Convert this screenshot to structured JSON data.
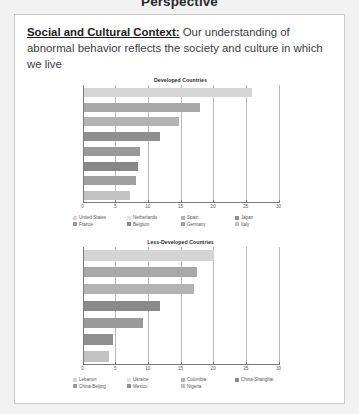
{
  "slide": {
    "title": "Perspective"
  },
  "body": {
    "lead": "Social and Cultural Context:",
    "text": " Our understanding of abnormal behavior reflects the society and culture in which we live"
  },
  "chart_data": [
    {
      "type": "bar",
      "orientation": "horizontal",
      "title": "Developed Countries",
      "xlabel": "",
      "ylabel": "",
      "xlim": [
        0,
        30
      ],
      "ticks": [
        0,
        5,
        10,
        15,
        20,
        25,
        30
      ],
      "tick_labels": [
        "0",
        "5",
        "10",
        "15",
        "20",
        "25",
        "30"
      ],
      "grid": true,
      "legend_position": "bottom",
      "categories": [
        "United States",
        "Netherlands",
        "Spain",
        "Japan",
        "France",
        "Belgium",
        "Germany",
        "Italy"
      ],
      "values": [
        26.0,
        18.0,
        14.8,
        11.8,
        8.8,
        8.5,
        8.2,
        7.3
      ],
      "colors": [
        "#d5d5d5",
        "#a8a8a8",
        "#b3b3b3",
        "#8f8f8f",
        "#9a9a9a",
        "#878787",
        "#a0a0a0",
        "#c2c2c2"
      ],
      "legend": [
        {
          "label": "United States",
          "color": "#d5d5d5"
        },
        {
          "label": "Netherlands",
          "color": "#e2e2e2"
        },
        {
          "label": "Spain",
          "color": "#b3b3b3"
        },
        {
          "label": "Japan",
          "color": "#8f8f8f"
        },
        {
          "label": "France",
          "color": "#9a9a9a"
        },
        {
          "label": "Belgium",
          "color": "#878787"
        },
        {
          "label": "Germany",
          "color": "#a0a0a0"
        },
        {
          "label": "Italy",
          "color": "#c2c2c2"
        }
      ]
    },
    {
      "type": "bar",
      "orientation": "horizontal",
      "title": "Less-Developed Countries",
      "xlabel": "",
      "ylabel": "",
      "xlim": [
        0,
        30
      ],
      "ticks": [
        0,
        5,
        10,
        15,
        20,
        25,
        30
      ],
      "tick_labels": [
        "0",
        "5",
        "10",
        "15",
        "20",
        "25",
        "30"
      ],
      "grid": true,
      "legend_position": "bottom",
      "categories": [
        "Lebanon",
        "Ukraine",
        "Colombia",
        "China-Shanghai",
        "China-Beijing",
        "Mexico",
        "Nigeria"
      ],
      "values": [
        20.2,
        17.5,
        17.0,
        11.8,
        9.2,
        4.6,
        4.1
      ],
      "colors": [
        "#d5d5d5",
        "#a8a8a8",
        "#b3b3b3",
        "#8a8a8a",
        "#9a9a9a",
        "#8f8f8f",
        "#c2c2c2"
      ],
      "legend": [
        {
          "label": "Lebanon",
          "color": "#d5d5d5"
        },
        {
          "label": "Ukraine",
          "color": "#e2e2e2"
        },
        {
          "label": "Colombia",
          "color": "#b3b3b3"
        },
        {
          "label": "China-Shanghai",
          "color": "#8a8a8a"
        },
        {
          "label": "China-Beijing",
          "color": "#9a9a9a"
        },
        {
          "label": "Mexico",
          "color": "#8f8f8f"
        },
        {
          "label": "Nigeria",
          "color": "#c2c2c2"
        }
      ]
    }
  ]
}
